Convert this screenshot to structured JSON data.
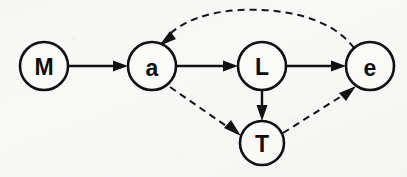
{
  "diagram": {
    "type": "directed-graph",
    "title": "",
    "background_color": "#f8f8f7",
    "node_fill": "#fbfbfa",
    "node_stroke": "#111111",
    "edge_color": "#111111",
    "nodes": [
      {
        "id": "M",
        "label": "M",
        "cx": 44,
        "cy": 66,
        "r": 24
      },
      {
        "id": "a",
        "label": "a",
        "cx": 152,
        "cy": 66,
        "r": 24
      },
      {
        "id": "L",
        "label": "L",
        "cx": 262,
        "cy": 66,
        "r": 24
      },
      {
        "id": "e",
        "label": "e",
        "cx": 370,
        "cy": 66,
        "r": 24
      },
      {
        "id": "T",
        "label": "T",
        "cx": 262,
        "cy": 143,
        "r": 22
      }
    ],
    "edges": [
      {
        "from": "M",
        "to": "a",
        "style": "solid",
        "shape": "straight",
        "arrow": true
      },
      {
        "from": "a",
        "to": "L",
        "style": "solid",
        "shape": "straight",
        "arrow": true
      },
      {
        "from": "L",
        "to": "e",
        "style": "solid",
        "shape": "straight",
        "arrow": true
      },
      {
        "from": "L",
        "to": "T",
        "style": "solid",
        "shape": "straight",
        "arrow": true
      },
      {
        "from": "a",
        "to": "T",
        "style": "dashed",
        "shape": "straight",
        "arrow": true
      },
      {
        "from": "T",
        "to": "e",
        "style": "dashed",
        "shape": "straight",
        "arrow": true
      },
      {
        "from": "e",
        "to": "a",
        "style": "dashed",
        "shape": "arc-over",
        "arrow": true
      }
    ]
  }
}
